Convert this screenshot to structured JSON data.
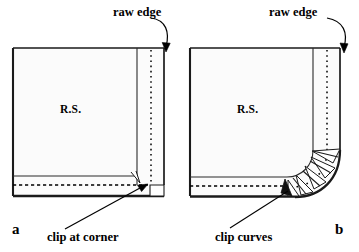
{
  "figure": {
    "background_color": "#ffffff",
    "line_color": "#000000",
    "fabric_fill": "#fbfbfb",
    "width": 359,
    "height": 252
  },
  "panels": [
    {
      "id": "a",
      "letter": "a",
      "raw_edge_label": "raw edge",
      "fabric_label": "R.S.",
      "caption": "clip at corner",
      "shape": "square-corner"
    },
    {
      "id": "b",
      "letter": "b",
      "raw_edge_label": "raw edge",
      "fabric_label": "R.S.",
      "caption": "clip curves",
      "shape": "rounded-corner"
    }
  ],
  "annotations": {
    "raw_edge_a": "raw edge",
    "raw_edge_b": "raw edge",
    "rs_a": "R.S.",
    "rs_b": "R.S.",
    "clip_at_corner": "clip at corner",
    "clip_curves": "clip curves",
    "letter_a": "a",
    "letter_b": "b"
  },
  "line_styles": {
    "outline": "solid",
    "seam_line": "solid-thin",
    "stitch_line": "dashed",
    "raw_edge_marker": "dotted"
  }
}
